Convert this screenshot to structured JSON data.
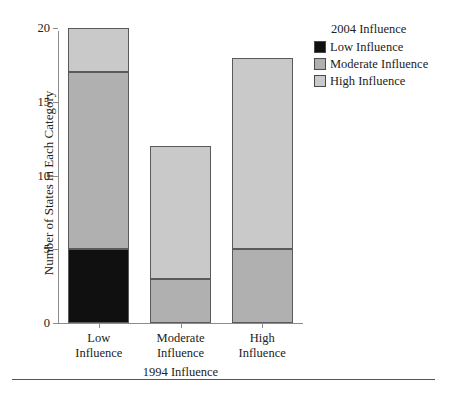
{
  "chart_data": {
    "type": "bar",
    "stacked": true,
    "title": "",
    "xlabel": "1994 Influence",
    "ylabel": "Number of States in Each Category",
    "categories": [
      "Low Influence",
      "Moderate Influence",
      "High Influence"
    ],
    "category_lines": [
      [
        "Low",
        "Influence"
      ],
      [
        "Moderate",
        "Influence"
      ],
      [
        "High",
        "Influence"
      ]
    ],
    "series": [
      {
        "name": "Low Influence",
        "color": "#101010",
        "values": [
          5,
          0,
          0
        ]
      },
      {
        "name": "Moderate Influence",
        "color": "#b0b0b0",
        "values": [
          12,
          3,
          5
        ]
      },
      {
        "name": "High Influence",
        "color": "#c9c9c9",
        "values": [
          3,
          9,
          13
        ]
      }
    ],
    "totals": [
      20,
      12,
      18
    ],
    "ylim": [
      0,
      20
    ],
    "yticks": [
      0,
      5,
      10,
      15,
      20
    ],
    "ytick_labels": [
      "0",
      "5",
      "10",
      "15",
      "20"
    ],
    "grid": false,
    "legend_position": "right-top"
  },
  "legend": {
    "title": "2004 Influence",
    "entries": [
      {
        "label": "Low Influence",
        "color": "#101010"
      },
      {
        "label": "Moderate Influence",
        "color": "#b0b0b0"
      },
      {
        "label": "High Influence",
        "color": "#c9c9c9"
      }
    ]
  }
}
